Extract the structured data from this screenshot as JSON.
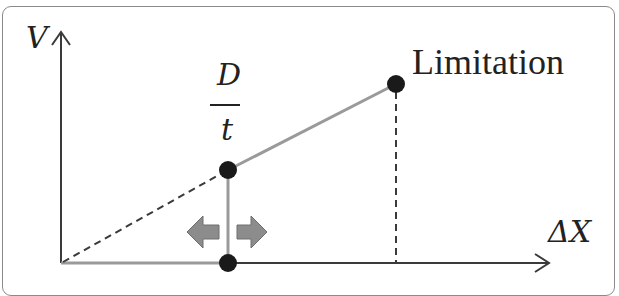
{
  "diagram": {
    "y_axis_label": "V",
    "x_axis_label": "ΔX",
    "fraction": {
      "numerator": "D",
      "denominator": "t"
    },
    "limitation_label": "Limitation",
    "points": [
      {
        "name": "origin-on-axis",
        "x": 228,
        "y": 263
      },
      {
        "name": "d-over-t",
        "x": 228,
        "y": 170
      },
      {
        "name": "limitation",
        "x": 396,
        "y": 84
      }
    ],
    "arrows": [
      "left",
      "right"
    ],
    "colors": {
      "axis": "#3a3a3a",
      "solid_line": "#9a9a9a",
      "dashed_line": "#3a3a3a",
      "point": "#1a1a1a",
      "arrow_fill": "#8c8c8c",
      "frame": "#8a8a8a",
      "text": "#222222"
    }
  }
}
